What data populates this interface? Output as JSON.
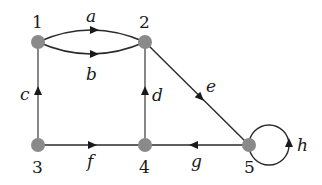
{
  "diagram": {
    "type": "directed-multigraph",
    "colors": {
      "node": "#8a8a8a",
      "edge": "#2a2a2a",
      "label": "#1a1a1a"
    },
    "nodes": [
      {
        "id": "1",
        "label": "1"
      },
      {
        "id": "2",
        "label": "2"
      },
      {
        "id": "3",
        "label": "3"
      },
      {
        "id": "4",
        "label": "4"
      },
      {
        "id": "5",
        "label": "5"
      }
    ],
    "edges": [
      {
        "label": "a",
        "from": "1",
        "to": "2"
      },
      {
        "label": "b",
        "from": "1",
        "to": "2"
      },
      {
        "label": "c",
        "from": "3",
        "to": "1"
      },
      {
        "label": "d",
        "from": "4",
        "to": "2"
      },
      {
        "label": "e",
        "from": "2",
        "to": "5"
      },
      {
        "label": "f",
        "from": "3",
        "to": "4"
      },
      {
        "label": "g",
        "from": "5",
        "to": "4"
      },
      {
        "label": "h",
        "from": "5",
        "to": "5"
      }
    ]
  }
}
